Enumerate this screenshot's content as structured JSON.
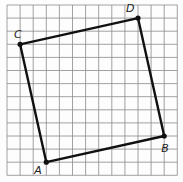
{
  "diagram": {
    "type": "square-on-grid",
    "grid": {
      "columns": 13,
      "rows": 13
    },
    "vertices": [
      {
        "label": "A",
        "x": 3,
        "y": 12
      },
      {
        "label": "B",
        "x": 12,
        "y": 10
      },
      {
        "label": "D",
        "x": 10,
        "y": 1
      },
      {
        "label": "C",
        "x": 1,
        "y": 3
      }
    ],
    "edges": [
      [
        "A",
        "B"
      ],
      [
        "B",
        "D"
      ],
      [
        "D",
        "C"
      ],
      [
        "C",
        "A"
      ]
    ],
    "colors": {
      "grid": "#8a8a8a",
      "shape": "#111111",
      "label": "#222222"
    }
  }
}
